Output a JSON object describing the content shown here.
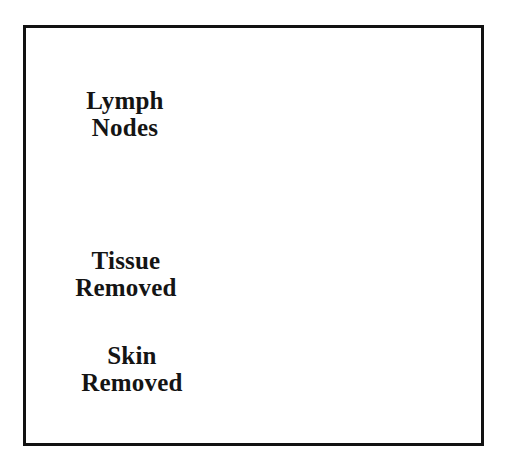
{
  "figure": {
    "background_color": "#ffffff",
    "ink_color": "#141414",
    "frame": {
      "border_color": "#111111",
      "border_width_px": 3
    }
  },
  "labels": [
    {
      "name": "lymph-nodes",
      "line1": "Lymph",
      "line2": "Nodes"
    },
    {
      "name": "tissue-removed",
      "line1": "Tissue",
      "line2": "Removed"
    },
    {
      "name": "skin-removed",
      "line1": "Skin",
      "line2": "Removed"
    }
  ],
  "annotations": {
    "leader_line_color": "#1a1a1a",
    "leader_line_count": 3,
    "dashed_outline_name": "excision-boundary",
    "lymph_node_count": 9
  }
}
